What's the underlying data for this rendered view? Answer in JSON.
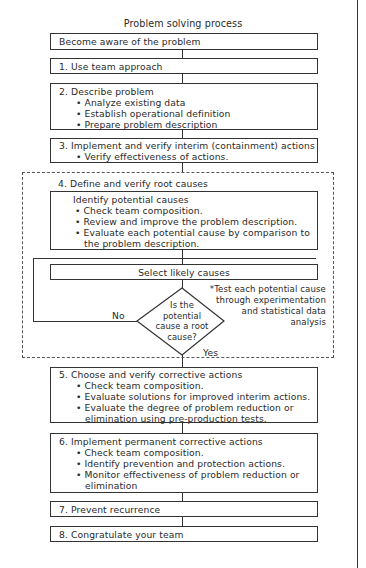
{
  "title": "Problem solving process",
  "start": "Become aware of the problem",
  "steps": {
    "s1": {
      "label": "1.  Use team approach"
    },
    "s2": {
      "label": "2.  Describe problem",
      "bullets": [
        "• Analyze existing data",
        "• Establish operational definition",
        "• Prepare problem description"
      ]
    },
    "s3": {
      "label": "3.  Implement and verify interim (containment) actions",
      "bullets": [
        "• Verify effectiveness of actions."
      ]
    },
    "s4": {
      "label": "4.  Define and verify root causes",
      "identify": {
        "heading": "Identify potential causes",
        "bullets": [
          "• Check team composition.",
          "• Review and improve the problem description.",
          "• Evaluate each potential cause by comparison to"
        ],
        "continuation": "the problem description."
      },
      "select": "Select likely causes",
      "decision": [
        "Is the",
        "potential",
        "cause a root",
        "cause?"
      ],
      "no_label": "No",
      "yes_label": "Yes",
      "note": [
        "*Test each potential cause",
        "through experimentation",
        "and statistical data",
        "analysis"
      ]
    },
    "s5": {
      "label": "5.  Choose and verify corrective actions",
      "bullets": [
        "• Check team composition.",
        "• Evaluate solutions for improved interim actions.",
        "• Evaluate the degree of problem reduction or"
      ],
      "continuation": "elimination using pre-production tests."
    },
    "s6": {
      "label": "6.  Implement permanent corrective actions",
      "bullets": [
        "• Check team composition.",
        "• Identify prevention and protection actions.",
        "• Monitor effectiveness of problem reduction or"
      ],
      "continuation": "elimination"
    },
    "s7": {
      "label": "7.  Prevent recurrence"
    },
    "s8": {
      "label": "8.  Congratulate your team"
    }
  }
}
